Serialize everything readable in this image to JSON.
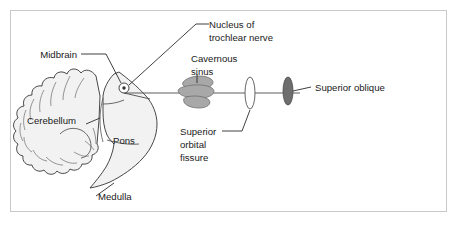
{
  "figure": {
    "kind": "anatomical-diagram",
    "background_color": "#ffffff",
    "frame_color": "#c9c9c9"
  },
  "labels": {
    "nucleus_line1": "Nucleus of",
    "nucleus_line2": "trochlear nerve",
    "midbrain": "Midbrain",
    "cavernous_line1": "Cavernous",
    "cavernous_line2": "sinus",
    "superior_oblique": "Superior oblique",
    "orbital_line1": "Superior",
    "orbital_line2": "orbital",
    "orbital_line3": "fissure",
    "cerebellum": "Cerebellum",
    "pons": "Pons",
    "medulla": "Medulla"
  },
  "structures": [
    {
      "name": "cerebellum",
      "shape": "lobulated-mass",
      "fill": "#f2f2f2",
      "stroke": "#333333"
    },
    {
      "name": "brainstem",
      "shape": "curved-stalk",
      "fill": "#f2f2f2",
      "stroke": "#333333"
    },
    {
      "name": "trochlear-nucleus",
      "shape": "small-circle-with-dot",
      "fill": "#ffffff",
      "stroke": "#333333",
      "dot_fill": "#333333"
    },
    {
      "name": "cavernous-sinus",
      "shape": "stacked-gray-lobes",
      "fill": "#a8a8a8",
      "stroke": "#6e6e6e"
    },
    {
      "name": "superior-orbital-fissure",
      "shape": "narrow-vertical-ellipse",
      "fill": "#ffffff",
      "stroke": "#555555"
    },
    {
      "name": "superior-oblique-muscle",
      "shape": "dark-vertical-ellipse",
      "fill": "#6e6e6e",
      "stroke": "#4a4a4a"
    },
    {
      "name": "trochlear-nerve-path",
      "shape": "horizontal-line",
      "stroke": "#4a4a4a"
    }
  ]
}
